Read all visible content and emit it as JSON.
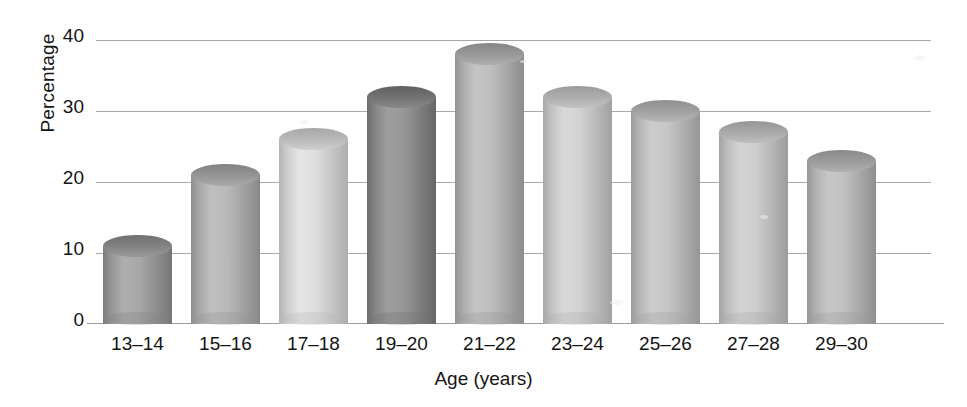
{
  "chart_data": {
    "type": "bar",
    "title": "",
    "xlabel": "Age (years)",
    "ylabel": "Percentage",
    "categories": [
      "13–14",
      "15–16",
      "17–18",
      "19–20",
      "21–22",
      "23–24",
      "25–26",
      "27–28",
      "29–30"
    ],
    "values": [
      11,
      21,
      26,
      32,
      38,
      32,
      30,
      27,
      23
    ],
    "ylim": [
      0,
      40
    ],
    "yticks": [
      0,
      10,
      20,
      30,
      40
    ],
    "ytick_labels": [
      "0",
      "10",
      "20",
      "30",
      "40"
    ],
    "grid": true,
    "legend": "none",
    "bar_style": "3d-cylinder",
    "bar_colors": [
      "#9e9e9e",
      "#b0b0b0",
      "#d5d5d5",
      "#8e8e8e",
      "#b4b4b4",
      "#c9c9c9",
      "#bdbdbd",
      "#c4c4c4",
      "#b7b7b7"
    ],
    "series": [
      {
        "name": "Percentage",
        "values": [
          11,
          21,
          26,
          32,
          38,
          32,
          30,
          27,
          23
        ]
      }
    ]
  },
  "axes": {
    "y_title": "Percentage",
    "x_title": "Age (years)",
    "gridline_color": "#a8a8a8",
    "text_color": "#141414"
  }
}
